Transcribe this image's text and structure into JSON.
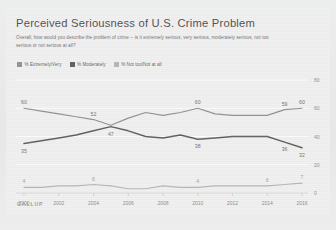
{
  "card": {
    "title": "Perceived Seriousness of U.S. Crime Problem",
    "subtitle": "Overall, how would you describe the problem of crime -- is it extremely serious, very serious, moderately serious, not too serious or not serious at all?",
    "source": "GALLUP"
  },
  "legend": [
    {
      "label": "% Extremely/Very",
      "color": "#8e8e8e"
    },
    {
      "label": "% Moderately",
      "color": "#5a5a5a"
    },
    {
      "label": "% Not too/Not at all",
      "color": "#b4b4b4"
    }
  ],
  "axis": {
    "y_ticks": [
      "80",
      "60",
      "40",
      "20",
      "0"
    ],
    "x_ticks": [
      "2000",
      "2002",
      "2004",
      "2006",
      "2008",
      "2010",
      "2012",
      "2014",
      "2016"
    ]
  },
  "point_labels": {
    "extremely_very": {
      "first": "60",
      "cross": "52",
      "mid": "60",
      "late": "59",
      "last": "60"
    },
    "moderately": {
      "first": "35",
      "cross": "47",
      "mid": "38",
      "late": "36",
      "last": "32"
    },
    "not_too": {
      "first": "4",
      "early": "6",
      "mid": "4",
      "late": "6",
      "last": "7"
    }
  },
  "chart_data": {
    "type": "line",
    "title": "Perceived Seriousness of U.S. Crime Problem",
    "subtitle": "Overall, how would you describe the problem of crime -- is it extremely serious, very serious, moderately serious, not too serious or not serious at all?",
    "xlabel": "",
    "ylabel": "",
    "ylim": [
      0,
      80
    ],
    "xlim": [
      2000,
      2016
    ],
    "grid": false,
    "legend_position": "top-left",
    "x": [
      2000,
      2001,
      2002,
      2003,
      2004,
      2005,
      2006,
      2007,
      2008,
      2009,
      2010,
      2011,
      2012,
      2013,
      2014,
      2015,
      2016
    ],
    "series": [
      {
        "name": "% Extremely/Very",
        "color": "#8e8e8e",
        "values": [
          60,
          58,
          56,
          54,
          52,
          48,
          53,
          57,
          55,
          57,
          60,
          56,
          55,
          55,
          55,
          59,
          60
        ],
        "labels": {
          "2000": "60",
          "2004": "52",
          "2010": "60",
          "2015": "59",
          "2016": "60"
        }
      },
      {
        "name": "% Moderately",
        "color": "#5a5a5a",
        "values": [
          35,
          37,
          39,
          41,
          44,
          47,
          44,
          40,
          39,
          41,
          38,
          39,
          40,
          40,
          40,
          36,
          32
        ],
        "labels": {
          "2000": "35",
          "2005": "47",
          "2010": "38",
          "2015": "36",
          "2016": "32"
        }
      },
      {
        "name": "% Not too/Not at all",
        "color": "#b4b4b4",
        "values": [
          4,
          4,
          5,
          5,
          6,
          5,
          3,
          3,
          5,
          4,
          4,
          5,
          5,
          5,
          5,
          6,
          7
        ],
        "labels": {
          "2000": "4",
          "2004": "6",
          "2010": "4",
          "2014": "6",
          "2016": "7"
        }
      }
    ]
  }
}
